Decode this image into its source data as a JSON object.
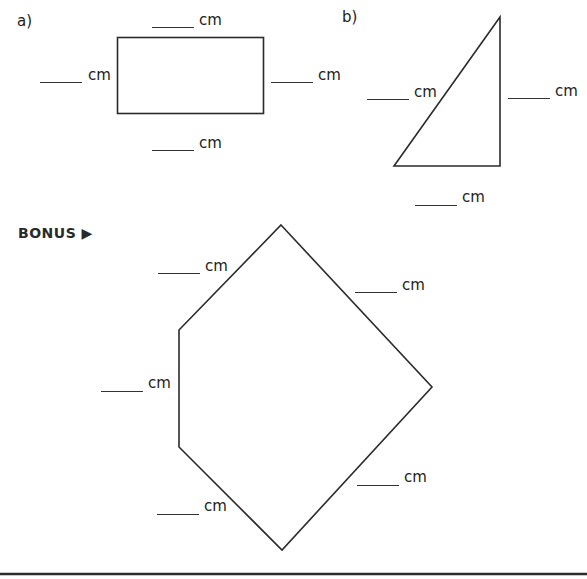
{
  "problems": [
    {
      "label": "a)",
      "shape": "rectangle"
    },
    {
      "label": "b)",
      "shape": "right-triangle"
    },
    {
      "label": "BONUS ▶",
      "shape": "pentagon"
    }
  ],
  "unit": "cm",
  "blanks": {
    "a_top": "cm",
    "a_left": "cm",
    "a_right": "cm",
    "a_bottom": "cm",
    "b_hyp": "cm",
    "b_right": "cm",
    "b_bottom": "cm",
    "p_upper_left": "cm",
    "p_upper_right": "cm",
    "p_left": "cm",
    "p_lower_right": "cm",
    "p_lower_left": "cm"
  },
  "colors": {
    "stroke": "#2b2b2b",
    "background": "#ffffff"
  }
}
